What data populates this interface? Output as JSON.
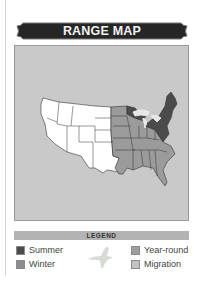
{
  "header": {
    "title": "RANGE MAP"
  },
  "map": {
    "region": "United States",
    "colors": {
      "background": "#c9c9c9",
      "nonrange": "#ffffff",
      "summer": "#4b4b4b",
      "winter": "#9b9b9b",
      "lakes": "#e6e6e6",
      "border": "#333333"
    }
  },
  "legend": {
    "title": "LEGEND",
    "items": [
      {
        "label": "Summer",
        "color": "#4b4b4b"
      },
      {
        "label": "Winter",
        "color": "#8c8c8c"
      },
      {
        "label": "Year-round",
        "color": "#9e9e9e"
      },
      {
        "label": "Migration",
        "color": "#c2c2c2"
      }
    ],
    "icon": "bird-silhouette-icon"
  }
}
